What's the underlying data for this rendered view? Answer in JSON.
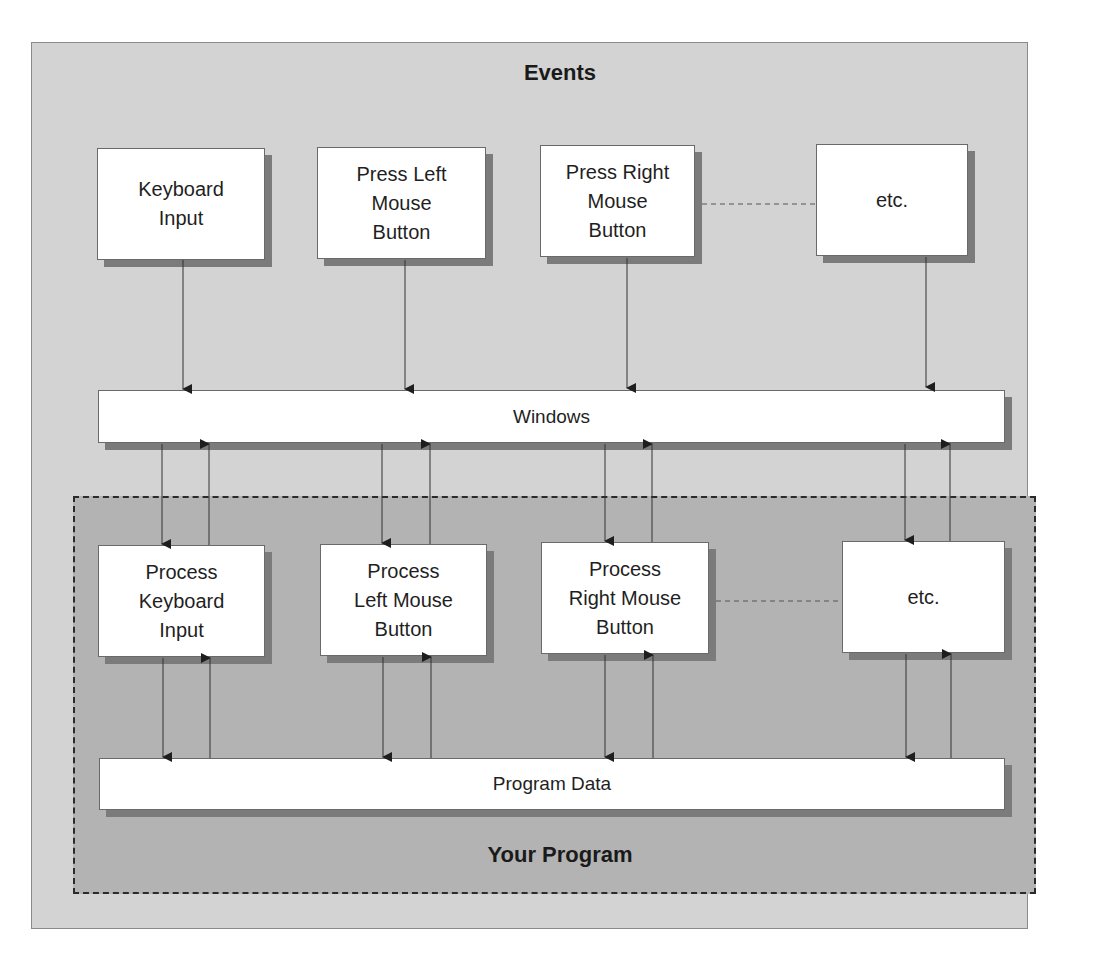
{
  "diagram": {
    "events_title": "Events",
    "program_title": "Your Program",
    "event_sources": [
      {
        "label": "Keyboard\nInput"
      },
      {
        "label": "Press Left\nMouse\nButton"
      },
      {
        "label": "Press Right\nMouse\nButton"
      },
      {
        "label": "etc."
      }
    ],
    "windows_bar": {
      "label": "Windows"
    },
    "handlers": [
      {
        "label": "Process\nKeyboard\nInput"
      },
      {
        "label": "Process\nLeft Mouse\nButton"
      },
      {
        "label": "Process\nRight Mouse\nButton"
      },
      {
        "label": "etc."
      }
    ],
    "program_data_bar": {
      "label": "Program Data"
    },
    "connectors": {
      "events_to_windows": "one-way down",
      "windows_to_handlers": "two-way (down and up)",
      "handlers_to_program_data": "two-way (down and up)",
      "ellipsis_links": "dashed line between third and fourth item in each row"
    },
    "colors": {
      "outer_background": "#d3d3d3",
      "program_region": "#b3b3b3",
      "box_fill": "#ffffff",
      "shadow": "#7b7b7b",
      "line": "#2a2a2a"
    }
  },
  "caption_fragment": ""
}
